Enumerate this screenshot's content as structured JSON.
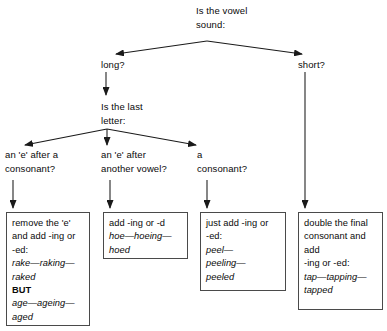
{
  "diagram": {
    "background_color": "#ffffff",
    "line_color": "#1a1a1a",
    "box_border_color": "#4a4a4a"
  },
  "nodes": {
    "root": "Is the vowel\nsound:",
    "long": "long?",
    "short": "short?",
    "last_letter": "Is the last\nletter:",
    "e_after_consonant": "an 'e' after a\nconsonant?",
    "e_after_vowel": "an 'e' after\nanother vowel?",
    "a_consonant": "a\nconsonant?"
  },
  "boxes": [
    {
      "id": "box-remove-e",
      "rule": "remove the 'e'\nand add -ing or\n-ed:",
      "example_1": "rake—raking—\nraked",
      "but_label": "BUT",
      "example_2": "age—ageing—\naged"
    },
    {
      "id": "box-add-ing-or-d",
      "rule": "add -ing or -d",
      "example_1": "hoe—hoeing—\nhoed"
    },
    {
      "id": "box-just-add",
      "rule": "just add -ing or\n-ed:",
      "example_1": "peel—\npeeling—\npeeled"
    },
    {
      "id": "box-double-consonant",
      "rule": "double the final\nconsonant and\nadd\n-ing or -ed:",
      "example_1": "tap—tapping—\ntapped"
    }
  ]
}
